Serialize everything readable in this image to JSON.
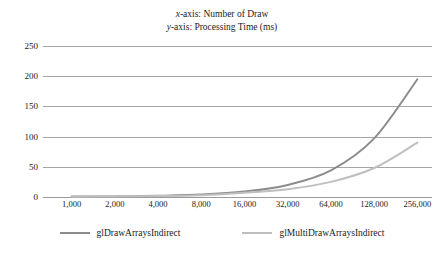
{
  "chart_data": {
    "type": "line",
    "title": "",
    "title_lines": [
      {
        "prefix_italic": "x",
        "rest": "-axis: Number of Draw"
      },
      {
        "prefix_italic": "y",
        "rest": "-axis: Processing Time (ms)"
      }
    ],
    "xlabel": "Number of Draw",
    "ylabel": "Processing Time (ms)",
    "categories": [
      "1,000",
      "2,000",
      "4,000",
      "8,000",
      "16,000",
      "32,000",
      "64,000",
      "128,000",
      "256,000"
    ],
    "ylim": [
      0,
      250
    ],
    "yticks": [
      0,
      50,
      100,
      150,
      200,
      250
    ],
    "ytick_labels": [
      "0",
      "50",
      "100",
      "150",
      "200",
      "250"
    ],
    "grid": "horizontal",
    "legend_position": "bottom",
    "series": [
      {
        "name": "glDrawArraysIndirect",
        "color": "#8c8c8c",
        "values": [
          1,
          1,
          2,
          4,
          9,
          20,
          44,
          97,
          195
        ]
      },
      {
        "name": "glMultiDrawArraysIndirect",
        "color": "#bfbfbf",
        "values": [
          0.5,
          1,
          1.5,
          3,
          7,
          13,
          25,
          48,
          90
        ]
      }
    ]
  },
  "legend": {
    "items": [
      {
        "label": "glDrawArraysIndirect",
        "color": "#8c8c8c"
      },
      {
        "label": "glMultiDrawArraysIndirect",
        "color": "#bfbfbf"
      }
    ]
  },
  "colors": {
    "gridline": "#a6a6a6",
    "text": "#1a1a1a",
    "background": "#ffffff"
  }
}
